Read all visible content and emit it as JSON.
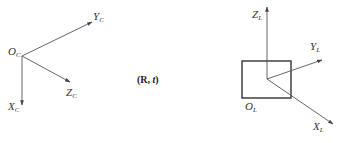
{
  "diagram": {
    "camera_frame": {
      "origin": {
        "main": "O",
        "sub": "C"
      },
      "axes": [
        {
          "main": "Y",
          "sub": "C"
        },
        {
          "main": "Z",
          "sub": "C"
        },
        {
          "main": "X",
          "sub": "C"
        }
      ]
    },
    "transform": {
      "open": "(",
      "R": "R",
      "sep": ", ",
      "t": "t",
      "close": ")"
    },
    "lidar_frame": {
      "origin": {
        "main": "O",
        "sub": "L"
      },
      "axes": [
        {
          "main": "Z",
          "sub": "L"
        },
        {
          "main": "Y",
          "sub": "L"
        },
        {
          "main": "X",
          "sub": "L"
        }
      ]
    },
    "colors": {
      "axis": "#555555",
      "box": "#333333",
      "text": "#333333",
      "background": "#ffffff"
    }
  }
}
